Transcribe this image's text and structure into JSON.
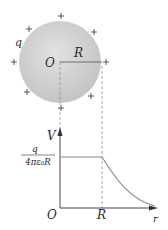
{
  "diagram": {
    "sphere": {
      "charge_label": "q",
      "center_label": "O",
      "radius_label": "R",
      "fill_color": "#c8c8c8",
      "charge_sign": "+",
      "charge_count": 8
    },
    "graph": {
      "y_axis_label": "V",
      "x_axis_label": "r",
      "origin_label": "O",
      "x_tick_label": "R",
      "plateau_value": {
        "numerator": "q",
        "denominator": "4πε₀R"
      },
      "curve_color": "#8a8a8a",
      "description": "V constant inside sphere (r ≤ R), decreases as 1/r outside"
    }
  }
}
